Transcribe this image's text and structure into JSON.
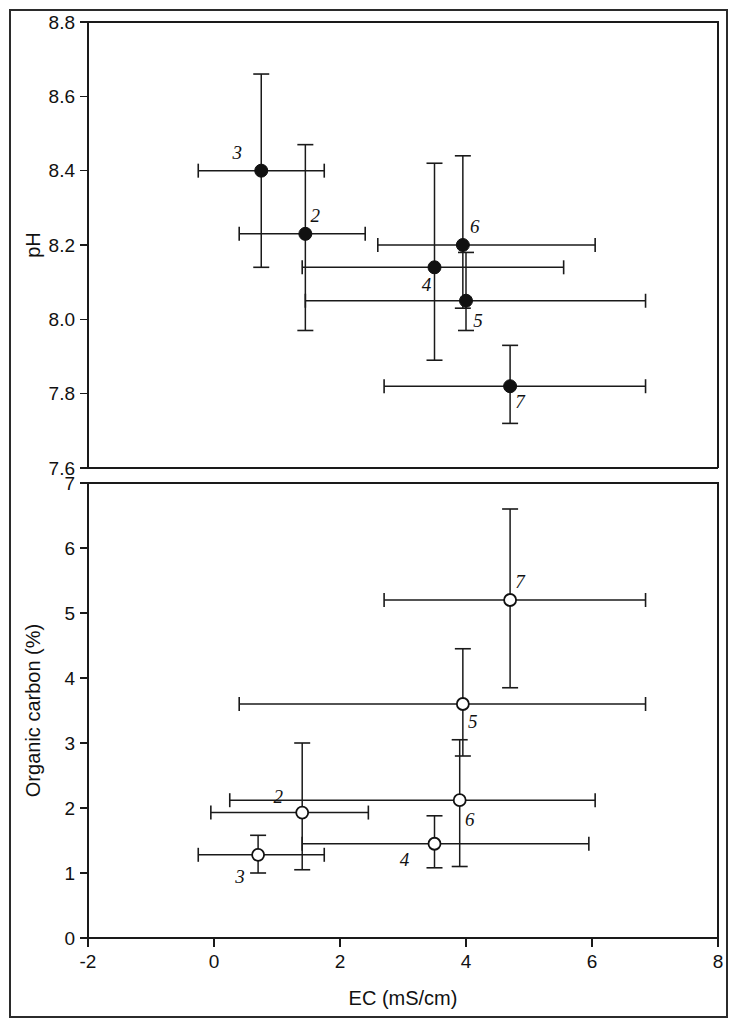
{
  "figure": {
    "xlabel": "EC (mS/cm)",
    "panels": [
      "ph-panel",
      "organic-carbon-panel"
    ]
  },
  "chart_data": [
    {
      "type": "scatter",
      "id": "ph-panel",
      "title": "",
      "xlabel": "EC (mS/cm)",
      "ylabel": "pH",
      "xlim": [
        -2,
        8
      ],
      "ylim": [
        7.6,
        8.8
      ],
      "xticks": [
        -2,
        0,
        2,
        4,
        6,
        8
      ],
      "xticklabels": [
        "-2",
        "0",
        "2",
        "4",
        "6",
        "8"
      ],
      "yticks": [
        7.6,
        7.8,
        8.0,
        8.2,
        8.4,
        8.6,
        8.8
      ],
      "yticklabels": [
        "7.6",
        "7.8",
        "8.0",
        "8.2",
        "8.4",
        "8.6",
        "8.8"
      ],
      "grid": false,
      "legend": "none",
      "marker": "filled-circle",
      "error_bars": "both",
      "points": [
        {
          "label": "3",
          "x": 0.75,
          "y": 8.4,
          "xerr_low": -0.25,
          "xerr_high": 1.75,
          "yerr_low": 8.14,
          "yerr_high": 8.66,
          "label_dx": -24,
          "label_dy": -12
        },
        {
          "label": "2",
          "x": 1.45,
          "y": 8.23,
          "xerr_low": 0.4,
          "xerr_high": 2.4,
          "yerr_low": 7.97,
          "yerr_high": 8.47,
          "label_dx": 10,
          "label_dy": -12
        },
        {
          "label": "6",
          "x": 3.95,
          "y": 8.2,
          "xerr_low": 2.6,
          "xerr_high": 6.05,
          "yerr_low": 8.03,
          "yerr_high": 8.44,
          "label_dx": 12,
          "label_dy": -12
        },
        {
          "label": "4",
          "x": 3.5,
          "y": 8.14,
          "xerr_low": 1.4,
          "xerr_high": 5.55,
          "yerr_low": 7.89,
          "yerr_high": 8.42,
          "label_dx": -8,
          "label_dy": 24
        },
        {
          "label": "5",
          "x": 4.0,
          "y": 8.05,
          "xerr_low": 1.45,
          "xerr_high": 6.85,
          "yerr_low": 7.97,
          "yerr_high": 8.18,
          "label_dx": 12,
          "label_dy": 26
        },
        {
          "label": "7",
          "x": 4.7,
          "y": 7.82,
          "xerr_low": 2.7,
          "xerr_high": 6.85,
          "yerr_low": 7.72,
          "yerr_high": 7.93,
          "label_dx": 10,
          "label_dy": 22
        }
      ]
    },
    {
      "type": "scatter",
      "id": "organic-carbon-panel",
      "title": "",
      "xlabel": "EC (mS/cm)",
      "ylabel": "Organic carbon (%)",
      "xlim": [
        -2,
        8
      ],
      "ylim": [
        0,
        7
      ],
      "xticks": [
        -2,
        0,
        2,
        4,
        6,
        8
      ],
      "xticklabels": [
        "-2",
        "0",
        "2",
        "4",
        "6",
        "8"
      ],
      "yticks": [
        0,
        1,
        2,
        3,
        4,
        5,
        6,
        7
      ],
      "yticklabels": [
        "0",
        "1",
        "2",
        "3",
        "4",
        "5",
        "6",
        "7"
      ],
      "grid": false,
      "legend": "none",
      "marker": "open-circle",
      "error_bars": "both",
      "points": [
        {
          "label": "7",
          "x": 4.7,
          "y": 5.2,
          "xerr_low": 2.7,
          "xerr_high": 6.85,
          "yerr_low": 3.85,
          "yerr_high": 6.6,
          "label_dx": 10,
          "label_dy": -12
        },
        {
          "label": "5",
          "x": 3.95,
          "y": 3.6,
          "xerr_low": 0.4,
          "xerr_high": 6.85,
          "yerr_low": 2.8,
          "yerr_high": 4.45,
          "label_dx": 10,
          "label_dy": 24
        },
        {
          "label": "6",
          "x": 3.9,
          "y": 2.12,
          "xerr_low": 0.25,
          "xerr_high": 6.05,
          "yerr_low": 1.1,
          "yerr_high": 3.05,
          "label_dx": 10,
          "label_dy": 26
        },
        {
          "label": "2",
          "x": 1.4,
          "y": 1.93,
          "xerr_low": -0.05,
          "xerr_high": 2.45,
          "yerr_low": 1.05,
          "yerr_high": 3.0,
          "label_dx": -24,
          "label_dy": -10
        },
        {
          "label": "4",
          "x": 3.5,
          "y": 1.45,
          "xerr_low": 1.4,
          "xerr_high": 5.95,
          "yerr_low": 1.08,
          "yerr_high": 1.88,
          "label_dx": -30,
          "label_dy": 22
        },
        {
          "label": "3",
          "x": 0.7,
          "y": 1.28,
          "xerr_low": -0.25,
          "xerr_high": 1.75,
          "yerr_low": 1.0,
          "yerr_high": 1.58,
          "label_dx": -18,
          "label_dy": 28
        }
      ]
    }
  ]
}
